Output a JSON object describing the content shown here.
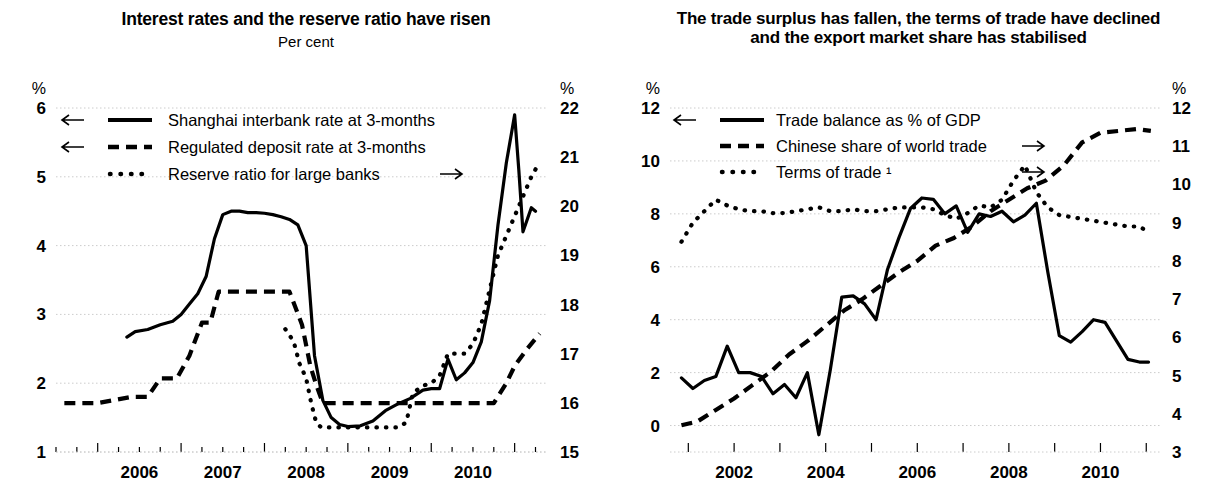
{
  "figure": {
    "panels": [
      {
        "id": "interest-rates",
        "title_line1": "Interest rates and the reserve ratio have risen",
        "title_line2": "",
        "subtitle": "Per cent",
        "left_unit": "%",
        "right_unit": "%",
        "legend": [
          {
            "label": "Shanghai interbank rate at 3-months",
            "style": "solid",
            "arrow": "left"
          },
          {
            "label": "Regulated deposit rate at 3-months",
            "style": "dashed",
            "arrow": "left"
          },
          {
            "label": "Reserve ratio for large banks",
            "style": "dotted",
            "arrow": "right"
          }
        ],
        "chart_data": {
          "type": "line",
          "title": "Interest rates and the reserve ratio have risen",
          "subtitle": "Per cent",
          "xlabel": "",
          "ylabel": "Per cent",
          "grid": true,
          "legend_position": "top-left",
          "xlim": [
            2005.5,
            2011.4
          ],
          "xticks": [
            2006,
            2007,
            2008,
            2009,
            2010
          ],
          "xticklabels": [
            "2006",
            "2007",
            "2008",
            "2009",
            "2010"
          ],
          "ylim": [
            1,
            6
          ],
          "yticks": [
            1,
            2,
            3,
            4,
            5,
            6
          ],
          "yticklabels": [
            "1",
            "2",
            "3",
            "4",
            "5",
            "6"
          ],
          "y2lim": [
            15,
            22
          ],
          "y2ticks": [
            15,
            16,
            17,
            18,
            19,
            20,
            21,
            22
          ],
          "y2ticklabels": [
            "15",
            "16",
            "17",
            "18",
            "19",
            "20",
            "21",
            "22"
          ],
          "series": [
            {
              "name": "Shanghai interbank rate at 3-months",
              "axis": "left",
              "style": "solid",
              "x": [
                2006.35,
                2006.45,
                2006.6,
                2006.75,
                2006.9,
                2007.0,
                2007.1,
                2007.2,
                2007.3,
                2007.4,
                2007.5,
                2007.6,
                2007.7,
                2007.8,
                2007.9,
                2008.0,
                2008.1,
                2008.2,
                2008.3,
                2008.4,
                2008.5,
                2008.6,
                2008.7,
                2008.8,
                2008.9,
                2009.0,
                2009.15,
                2009.3,
                2009.45,
                2009.6,
                2009.75,
                2009.9,
                2010.0,
                2010.1,
                2010.2,
                2010.3,
                2010.4,
                2010.5,
                2010.6,
                2010.7,
                2010.8,
                2010.9,
                2011.0,
                2011.05,
                2011.1,
                2011.2,
                2011.25
              ],
              "y": [
                2.67,
                2.75,
                2.78,
                2.85,
                2.9,
                3.0,
                3.15,
                3.3,
                3.55,
                4.1,
                4.45,
                4.5,
                4.5,
                4.48,
                4.48,
                4.47,
                4.45,
                4.42,
                4.38,
                4.3,
                4.0,
                2.4,
                1.75,
                1.5,
                1.4,
                1.37,
                1.38,
                1.45,
                1.6,
                1.7,
                1.78,
                1.9,
                1.92,
                1.92,
                2.35,
                2.05,
                2.15,
                2.3,
                2.6,
                3.2,
                4.3,
                5.2,
                5.9,
                5.1,
                4.2,
                4.55,
                4.5
              ]
            },
            {
              "name": "Regulated deposit rate at 3-months",
              "axis": "left",
              "style": "dashed",
              "x": [
                2005.6,
                2006.0,
                2006.4,
                2006.6,
                2006.75,
                2006.95,
                2007.1,
                2007.25,
                2007.35,
                2007.45,
                2007.6,
                2008.0,
                2008.3,
                2008.45,
                2008.55,
                2008.62,
                2008.7,
                2009.0,
                2009.5,
                2010.0,
                2010.5,
                2010.75,
                2010.9,
                2011.0,
                2011.15,
                2011.3
              ],
              "y": [
                1.71,
                1.71,
                1.8,
                1.8,
                2.07,
                2.07,
                2.4,
                2.88,
                2.88,
                3.33,
                3.33,
                3.33,
                3.33,
                2.85,
                2.25,
                1.98,
                1.71,
                1.71,
                1.71,
                1.71,
                1.71,
                1.71,
                2.0,
                2.25,
                2.5,
                2.72
              ]
            },
            {
              "name": "Reserve ratio for large banks",
              "axis": "right",
              "style": "dotted",
              "x": [
                2008.25,
                2008.35,
                2008.42,
                2008.5,
                2008.56,
                2008.62,
                2008.68,
                2008.75,
                2008.85,
                2009.0,
                2009.2,
                2009.4,
                2009.6,
                2009.7,
                2009.78,
                2009.9,
                2010.0,
                2010.1,
                2010.2,
                2010.3,
                2010.4,
                2010.5,
                2010.6,
                2010.7,
                2010.8,
                2010.9,
                2011.0,
                2011.1,
                2011.2,
                2011.3
              ],
              "y": [
                17.5,
                17.25,
                16.8,
                16.5,
                16.0,
                15.6,
                15.5,
                15.5,
                15.5,
                15.5,
                15.5,
                15.5,
                15.5,
                15.6,
                16.2,
                16.35,
                16.4,
                16.55,
                17.0,
                17.0,
                17.0,
                17.2,
                17.6,
                18.3,
                19.0,
                19.4,
                19.8,
                20.2,
                20.6,
                20.9
              ]
            }
          ]
        }
      },
      {
        "id": "trade",
        "title_line1": "The trade surplus has fallen, the terms of trade have declined",
        "title_line2": "and the export market share has stabilised",
        "subtitle": "",
        "left_unit": "%",
        "right_unit": "%",
        "legend": [
          {
            "label": "Trade balance as % of GDP",
            "style": "solid",
            "arrow": "left"
          },
          {
            "label": "Chinese share of world trade",
            "style": "dashed",
            "arrow": "right"
          },
          {
            "label": "Terms of trade ¹",
            "style": "dotted",
            "arrow": "right"
          }
        ],
        "chart_data": {
          "type": "line",
          "title": "The trade surplus has fallen, the terms of trade have declined and the export market share has stabilised",
          "subtitle": "",
          "xlabel": "",
          "ylabel": "Per cent",
          "grid": true,
          "legend_position": "top-left",
          "xlim": [
            2000.6,
            2011.3
          ],
          "xticks": [
            2002,
            2004,
            2006,
            2008,
            2010
          ],
          "xticklabels": [
            "2002",
            "2004",
            "2006",
            "2008",
            "2010"
          ],
          "xminorticks": [
            2001,
            2002,
            2003,
            2004,
            2005,
            2006,
            2007,
            2008,
            2009,
            2010,
            2011
          ],
          "ylim": [
            -1,
            12
          ],
          "yticks": [
            0,
            2,
            4,
            6,
            8,
            10,
            12
          ],
          "yticklabels": [
            "0",
            "2",
            "4",
            "6",
            "8",
            "10",
            "12"
          ],
          "y2lim": [
            3,
            12
          ],
          "y2ticks": [
            3,
            4,
            5,
            6,
            7,
            8,
            9,
            10,
            11,
            12
          ],
          "y2ticklabels": [
            "3",
            "4",
            "5",
            "6",
            "7",
            "8",
            "9",
            "10",
            "11",
            "12"
          ],
          "series": [
            {
              "name": "Trade balance as % of GDP",
              "axis": "left",
              "style": "solid",
              "x": [
                2000.85,
                2001.1,
                2001.35,
                2001.6,
                2001.85,
                2002.1,
                2002.35,
                2002.6,
                2002.85,
                2003.1,
                2003.35,
                2003.6,
                2003.85,
                2004.1,
                2004.35,
                2004.6,
                2004.85,
                2005.1,
                2005.35,
                2005.6,
                2005.85,
                2006.1,
                2006.35,
                2006.6,
                2006.85,
                2007.1,
                2007.35,
                2007.6,
                2007.85,
                2008.1,
                2008.35,
                2008.6,
                2008.85,
                2009.1,
                2009.35,
                2009.6,
                2009.85,
                2010.1,
                2010.35,
                2010.6,
                2010.85,
                2011.05
              ],
              "y": [
                1.8,
                1.4,
                1.7,
                1.85,
                3.0,
                2.0,
                2.0,
                1.85,
                1.2,
                1.55,
                1.05,
                2.0,
                -0.35,
                2.1,
                4.85,
                4.9,
                4.6,
                4.0,
                5.9,
                7.1,
                8.2,
                8.6,
                8.55,
                8.0,
                8.3,
                7.3,
                8.0,
                7.9,
                8.1,
                7.7,
                7.95,
                8.4,
                5.8,
                3.4,
                3.15,
                3.55,
                4.0,
                3.9,
                3.2,
                2.5,
                2.4,
                2.4
              ]
            },
            {
              "name": "Chinese share of world trade",
              "axis": "right",
              "style": "dashed",
              "x": [
                2000.85,
                2001.2,
                2001.6,
                2002.0,
                2002.4,
                2002.8,
                2003.2,
                2003.6,
                2004.0,
                2004.4,
                2004.8,
                2005.2,
                2005.6,
                2006.0,
                2006.4,
                2006.8,
                2007.2,
                2007.6,
                2008.0,
                2008.4,
                2008.8,
                2009.2,
                2009.6,
                2010.0,
                2010.4,
                2010.8,
                2011.1
              ],
              "y": [
                3.7,
                3.8,
                4.1,
                4.4,
                4.75,
                5.1,
                5.55,
                5.9,
                6.3,
                6.7,
                7.0,
                7.35,
                7.7,
                8.0,
                8.4,
                8.6,
                8.9,
                9.3,
                9.6,
                9.9,
                10.1,
                10.5,
                11.1,
                11.35,
                11.4,
                11.45,
                11.4
              ]
            },
            {
              "name": "Terms of trade",
              "axis": "right",
              "style": "dotted",
              "x": [
                2000.85,
                2001.1,
                2001.35,
                2001.6,
                2001.85,
                2002.1,
                2002.35,
                2002.6,
                2002.85,
                2003.1,
                2003.35,
                2003.6,
                2003.85,
                2004.1,
                2004.35,
                2004.6,
                2004.85,
                2005.1,
                2005.35,
                2005.6,
                2005.85,
                2006.1,
                2006.35,
                2006.6,
                2006.85,
                2007.1,
                2007.35,
                2007.6,
                2007.85,
                2008.1,
                2008.35,
                2008.6,
                2008.85,
                2009.1,
                2009.35,
                2009.6,
                2009.85,
                2010.1,
                2010.35,
                2010.6,
                2010.85,
                2011.05
              ],
              "y": [
                8.5,
                9.0,
                9.3,
                9.6,
                9.45,
                9.35,
                9.3,
                9.3,
                9.25,
                9.25,
                9.3,
                9.35,
                9.4,
                9.3,
                9.3,
                9.35,
                9.3,
                9.3,
                9.35,
                9.4,
                9.4,
                9.4,
                9.35,
                9.2,
                9.1,
                9.25,
                9.45,
                9.4,
                9.6,
                10.1,
                10.5,
                9.8,
                9.4,
                9.2,
                9.15,
                9.1,
                9.05,
                9.0,
                8.95,
                8.9,
                8.9,
                8.75
              ]
            }
          ]
        }
      }
    ]
  },
  "colors": {
    "ink": "#000000",
    "grid": "#cccccc",
    "background": "#ffffff"
  }
}
